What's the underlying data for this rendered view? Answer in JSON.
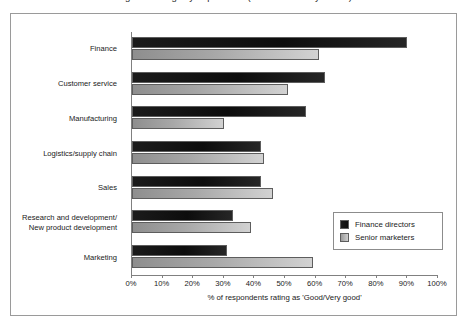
{
  "clipped_title": "Figure: Ratings by department (descenders only visible)",
  "chart_data": {
    "type": "bar",
    "orientation": "horizontal",
    "title": "",
    "xlabel": "% of respondents rating as 'Good/Very good'",
    "ylabel": "",
    "xlim": [
      0,
      100
    ],
    "xticks": [
      "0%",
      "10%",
      "20%",
      "30%",
      "40%",
      "50%",
      "60%",
      "70%",
      "80%",
      "90%",
      "100%"
    ],
    "xtick_values": [
      0,
      10,
      20,
      30,
      40,
      50,
      60,
      70,
      80,
      90,
      100
    ],
    "grid": false,
    "legend_position": "inside-lower-right",
    "categories": [
      "Finance",
      "Customer service",
      "Manufacturing",
      "Logistics/supply chain",
      "Sales",
      "Research and development/\nNew product development",
      "Marketing"
    ],
    "series": [
      {
        "name": "Finance directors",
        "color": "#141414",
        "values": [
          90,
          63,
          57,
          42,
          42,
          33,
          31
        ]
      },
      {
        "name": "Senior marketers",
        "color": "#aaaaaa",
        "values": [
          61,
          51,
          30,
          43,
          46,
          39,
          59
        ]
      }
    ]
  },
  "axis": {
    "title": "% of respondents rating as 'Good/Very good'"
  },
  "legend": {
    "items": [
      {
        "label": "Finance directors",
        "swatch": "dark"
      },
      {
        "label": "Senior marketers",
        "swatch": "light"
      }
    ]
  }
}
